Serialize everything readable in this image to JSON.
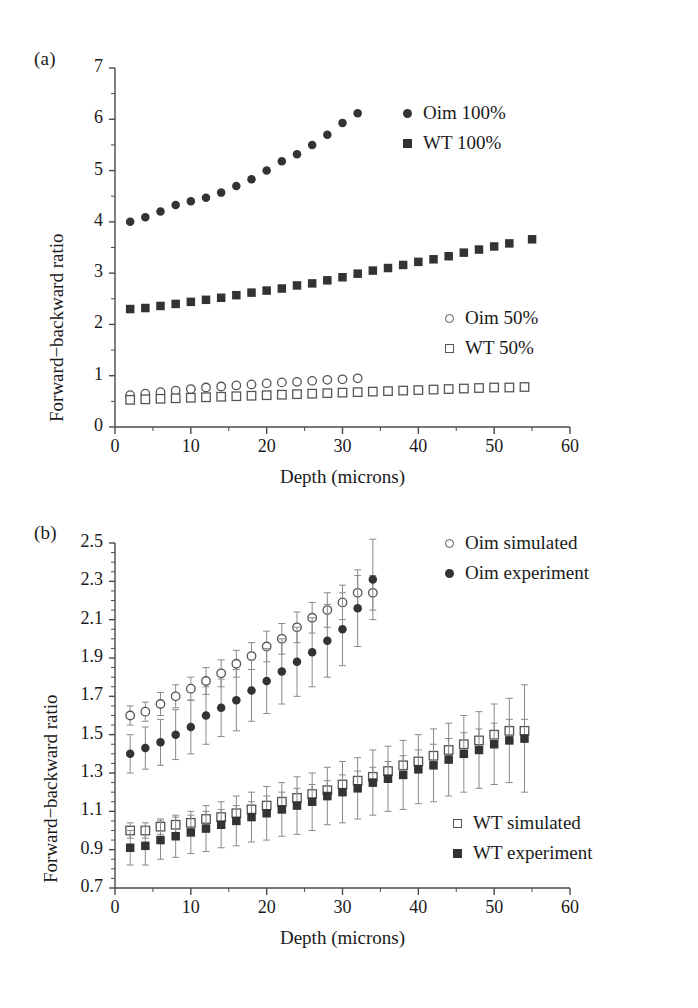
{
  "figure": {
    "panel_a_label": "(a)",
    "panel_b_label": "(b)"
  },
  "chart_data": [
    {
      "type": "scatter",
      "panel": "(a)",
      "title": "",
      "xlabel": "Depth (microns)",
      "ylabel": "Forward−backward ratio",
      "xlim": [
        0,
        60
      ],
      "ylim": [
        0,
        7
      ],
      "xticks": [
        0,
        10,
        20,
        30,
        40,
        50,
        60
      ],
      "xtick_labels": [
        "0",
        "10",
        "20",
        "30",
        "40",
        "50",
        "60"
      ],
      "xminor_step": 5,
      "yticks": [
        0,
        1,
        2,
        3,
        4,
        5,
        6,
        7
      ],
      "ytick_labels": [
        "0",
        "1",
        "2",
        "3",
        "4",
        "5",
        "6",
        "7"
      ],
      "yminor_step": 0.5,
      "grid": false,
      "legend_position": "inside upper-right and middle-right",
      "series": [
        {
          "name": "Oim 100%",
          "marker": "filled-circle",
          "color": "#333333",
          "x": [
            2,
            4,
            6,
            8,
            10,
            12,
            14,
            16,
            18,
            20,
            22,
            24,
            26,
            28,
            30,
            32
          ],
          "y": [
            4.0,
            4.09,
            4.2,
            4.33,
            4.4,
            4.47,
            4.57,
            4.7,
            4.83,
            5.0,
            5.18,
            5.32,
            5.5,
            5.7,
            5.93,
            6.12,
            6.42
          ]
        },
        {
          "name": "WT 100%",
          "marker": "filled-square",
          "color": "#333333",
          "x": [
            2,
            4,
            6,
            8,
            10,
            12,
            14,
            16,
            18,
            20,
            22,
            24,
            26,
            28,
            30,
            32,
            34,
            36,
            38,
            40,
            42,
            44,
            46,
            48,
            50,
            52,
            55
          ],
          "y": [
            2.3,
            2.32,
            2.36,
            2.4,
            2.44,
            2.48,
            2.52,
            2.57,
            2.62,
            2.66,
            2.7,
            2.76,
            2.8,
            2.86,
            2.92,
            2.99,
            3.05,
            3.1,
            3.16,
            3.22,
            3.27,
            3.33,
            3.4,
            3.46,
            3.52,
            3.58,
            3.66
          ]
        },
        {
          "name": "Oim 50%",
          "marker": "open-circle",
          "color": "#555555",
          "x": [
            2,
            4,
            6,
            8,
            10,
            12,
            14,
            16,
            18,
            20,
            22,
            24,
            26,
            28,
            30,
            32
          ],
          "y": [
            0.62,
            0.65,
            0.68,
            0.71,
            0.74,
            0.77,
            0.79,
            0.81,
            0.83,
            0.85,
            0.87,
            0.88,
            0.9,
            0.92,
            0.93,
            0.95
          ]
        },
        {
          "name": "WT 50%",
          "marker": "open-square",
          "color": "#555555",
          "x": [
            2,
            4,
            6,
            8,
            10,
            12,
            14,
            16,
            18,
            20,
            22,
            24,
            26,
            28,
            30,
            32,
            34,
            36,
            38,
            40,
            42,
            44,
            46,
            48,
            50,
            52,
            54
          ],
          "y": [
            0.53,
            0.54,
            0.55,
            0.56,
            0.57,
            0.58,
            0.59,
            0.6,
            0.61,
            0.62,
            0.63,
            0.64,
            0.65,
            0.66,
            0.67,
            0.68,
            0.69,
            0.7,
            0.71,
            0.72,
            0.73,
            0.74,
            0.75,
            0.76,
            0.77,
            0.77,
            0.78
          ]
        }
      ],
      "legends": [
        {
          "label": "Oim 100%",
          "marker": "filled-circle"
        },
        {
          "label": "WT 100%",
          "marker": "filled-square"
        },
        {
          "label": "Oim 50%",
          "marker": "open-circle"
        },
        {
          "label": "WT 50%",
          "marker": "open-square"
        }
      ]
    },
    {
      "type": "scatter",
      "panel": "(b)",
      "title": "",
      "xlabel": "Depth (microns)",
      "ylabel": "Forward−backward ratio",
      "xlim": [
        0,
        60
      ],
      "ylim": [
        0.7,
        2.5
      ],
      "xticks": [
        0,
        10,
        20,
        30,
        40,
        50,
        60
      ],
      "xtick_labels": [
        "0",
        "10",
        "20",
        "30",
        "40",
        "50",
        "60"
      ],
      "xminor_step": 5,
      "yticks": [
        0.7,
        0.9,
        1.1,
        1.3,
        1.5,
        1.7,
        1.9,
        2.1,
        2.3,
        2.5
      ],
      "ytick_labels": [
        "0.7",
        "0.9",
        "1.1",
        "1.3",
        "1.5",
        "1.7",
        "1.9",
        "2.1",
        "2.3",
        "2.5"
      ],
      "yminor_step": 0.05,
      "grid": false,
      "errorbars": true,
      "legend_position": "inside upper-right and lower-right",
      "series": [
        {
          "name": "Oim simulated",
          "marker": "open-circle",
          "color": "#555555",
          "x": [
            2,
            4,
            6,
            8,
            10,
            12,
            14,
            16,
            18,
            20,
            22,
            24,
            26,
            28,
            30,
            32,
            34
          ],
          "y": [
            1.6,
            1.62,
            1.66,
            1.7,
            1.74,
            1.78,
            1.82,
            1.87,
            1.91,
            1.96,
            2.0,
            2.06,
            2.11,
            2.15,
            2.19,
            2.24,
            2.24
          ],
          "yerr": [
            0.05,
            0.05,
            0.06,
            0.06,
            0.06,
            0.07,
            0.07,
            0.07,
            0.07,
            0.08,
            0.08,
            0.08,
            0.08,
            0.09,
            0.09,
            0.09,
            0.09
          ]
        },
        {
          "name": "Oim experiment",
          "marker": "filled-circle",
          "color": "#333333",
          "x": [
            2,
            4,
            6,
            8,
            10,
            12,
            14,
            16,
            18,
            20,
            22,
            24,
            26,
            28,
            30,
            32,
            34
          ],
          "y": [
            1.4,
            1.43,
            1.46,
            1.5,
            1.54,
            1.6,
            1.64,
            1.68,
            1.73,
            1.78,
            1.83,
            1.88,
            1.93,
            1.99,
            2.05,
            2.16,
            2.31
          ],
          "yerr": [
            0.1,
            0.11,
            0.12,
            0.13,
            0.14,
            0.15,
            0.15,
            0.16,
            0.16,
            0.17,
            0.17,
            0.18,
            0.18,
            0.19,
            0.19,
            0.2,
            0.21
          ]
        },
        {
          "name": "WT simulated",
          "marker": "open-square",
          "color": "#555555",
          "x": [
            2,
            4,
            6,
            8,
            10,
            12,
            14,
            16,
            18,
            20,
            22,
            24,
            26,
            28,
            30,
            32,
            34,
            36,
            38,
            40,
            42,
            44,
            46,
            48,
            50,
            52,
            54
          ],
          "y": [
            1.0,
            1.0,
            1.02,
            1.03,
            1.04,
            1.06,
            1.07,
            1.09,
            1.11,
            1.13,
            1.15,
            1.17,
            1.19,
            1.21,
            1.24,
            1.26,
            1.28,
            1.31,
            1.34,
            1.36,
            1.39,
            1.42,
            1.45,
            1.47,
            1.5,
            1.52,
            1.52
          ],
          "yerr": [
            0.04,
            0.04,
            0.04,
            0.04,
            0.04,
            0.04,
            0.04,
            0.04,
            0.04,
            0.05,
            0.05,
            0.05,
            0.05,
            0.05,
            0.05,
            0.05,
            0.05,
            0.05,
            0.05,
            0.06,
            0.06,
            0.06,
            0.06,
            0.06,
            0.06,
            0.06,
            0.06
          ]
        },
        {
          "name": "WT experiment",
          "marker": "filled-square",
          "color": "#333333",
          "x": [
            2,
            4,
            6,
            8,
            10,
            12,
            14,
            16,
            18,
            20,
            22,
            24,
            26,
            28,
            30,
            32,
            34,
            36,
            38,
            40,
            42,
            44,
            46,
            48,
            50,
            52,
            54
          ],
          "y": [
            0.91,
            0.92,
            0.95,
            0.97,
            0.99,
            1.01,
            1.03,
            1.05,
            1.07,
            1.09,
            1.11,
            1.13,
            1.15,
            1.18,
            1.2,
            1.22,
            1.25,
            1.27,
            1.29,
            1.32,
            1.34,
            1.37,
            1.4,
            1.42,
            1.45,
            1.47,
            1.48
          ],
          "yerr": [
            0.09,
            0.1,
            0.1,
            0.11,
            0.11,
            0.12,
            0.12,
            0.13,
            0.13,
            0.14,
            0.14,
            0.15,
            0.15,
            0.15,
            0.16,
            0.16,
            0.17,
            0.17,
            0.18,
            0.18,
            0.19,
            0.19,
            0.2,
            0.2,
            0.21,
            0.22,
            0.28
          ]
        }
      ],
      "legends": [
        {
          "label": "Oim simulated",
          "marker": "open-circle"
        },
        {
          "label": "Oim experiment",
          "marker": "filled-circle"
        },
        {
          "label": "WT simulated",
          "marker": "open-square"
        },
        {
          "label": "WT experiment",
          "marker": "filled-square"
        }
      ]
    }
  ]
}
